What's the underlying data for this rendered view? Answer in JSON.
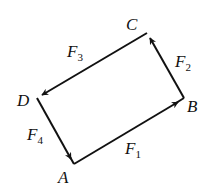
{
  "diagram": {
    "title": "",
    "points": {
      "A": {
        "label": "A",
        "x": 74,
        "y": 164
      },
      "B": {
        "label": "B",
        "x": 184,
        "y": 98
      },
      "C": {
        "label": "C",
        "x": 147,
        "y": 33
      },
      "D": {
        "label": "D",
        "x": 37,
        "y": 98
      }
    },
    "vectors": [
      {
        "name": "F",
        "sub": "1",
        "from": "A",
        "to": "B"
      },
      {
        "name": "F",
        "sub": "2",
        "from": "B",
        "to": "C"
      },
      {
        "name": "F",
        "sub": "3",
        "from": "C",
        "to": "D"
      },
      {
        "name": "F",
        "sub": "4",
        "from": "D",
        "to": "A"
      }
    ],
    "line_color": "#111111"
  }
}
